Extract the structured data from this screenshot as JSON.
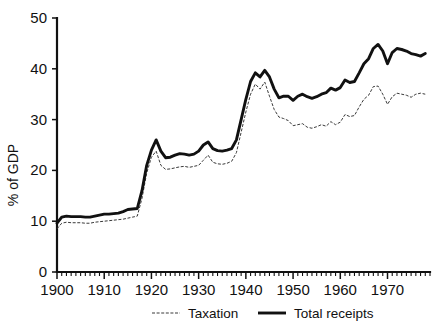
{
  "chart_data": {
    "type": "line",
    "title": "",
    "xlabel": "",
    "ylabel": "% of GDP",
    "xlim": [
      1900,
      1979
    ],
    "ylim": [
      0,
      50
    ],
    "grid": false,
    "legend_position": "bottom",
    "y_ticks": [
      0,
      10,
      20,
      30,
      40,
      50
    ],
    "y_tick_labels": [
      "0",
      "10",
      "20",
      "30",
      "40",
      "50"
    ],
    "x_ticks": [
      1900,
      1910,
      1920,
      1930,
      1940,
      1950,
      1960,
      1970
    ],
    "x_tick_labels": [
      "1900",
      "1910",
      "1920",
      "1930",
      "1940",
      "1950",
      "1960",
      "1970"
    ],
    "x_minor_tick_step": 1,
    "x": [
      1900,
      1901,
      1902,
      1903,
      1904,
      1905,
      1906,
      1907,
      1908,
      1909,
      1910,
      1911,
      1912,
      1913,
      1914,
      1915,
      1916,
      1917,
      1918,
      1919,
      1920,
      1921,
      1922,
      1923,
      1924,
      1925,
      1926,
      1927,
      1928,
      1929,
      1930,
      1931,
      1932,
      1933,
      1934,
      1935,
      1936,
      1937,
      1938,
      1939,
      1940,
      1941,
      1942,
      1943,
      1944,
      1945,
      1946,
      1947,
      1948,
      1949,
      1950,
      1951,
      1952,
      1953,
      1954,
      1955,
      1956,
      1957,
      1958,
      1959,
      1960,
      1961,
      1962,
      1963,
      1964,
      1965,
      1966,
      1967,
      1968,
      1969,
      1970,
      1971,
      1972,
      1973,
      1974,
      1975,
      1976,
      1977,
      1978
    ],
    "series": [
      {
        "name": "Total receipts",
        "style": "solid",
        "color": "#111111",
        "values": [
          9.6,
          10.8,
          11.0,
          10.9,
          10.9,
          10.9,
          10.8,
          10.8,
          11.0,
          11.2,
          11.4,
          11.4,
          11.5,
          11.6,
          11.9,
          12.3,
          12.4,
          12.5,
          16.0,
          21.0,
          24.0,
          26.0,
          23.8,
          22.5,
          22.6,
          23.0,
          23.3,
          23.2,
          23.0,
          23.2,
          23.8,
          25.0,
          25.6,
          24.3,
          23.9,
          23.8,
          24.0,
          24.3,
          26.0,
          30.0,
          34.0,
          37.5,
          39.2,
          38.4,
          39.7,
          38.4,
          36.0,
          34.3,
          34.6,
          34.6,
          33.8,
          34.6,
          35.0,
          34.5,
          34.2,
          34.5,
          35.0,
          35.3,
          36.2,
          35.8,
          36.3,
          37.8,
          37.3,
          37.5,
          39.2,
          41.0,
          42.0,
          44.0,
          44.8,
          43.5,
          41.0,
          43.2,
          44.0,
          43.8,
          43.5,
          43.0,
          42.8,
          42.5,
          43.0
        ]
      },
      {
        "name": "Taxation",
        "style": "dotted",
        "color": "#3a3a3a",
        "values": [
          8.5,
          9.6,
          9.8,
          9.7,
          9.7,
          9.7,
          9.6,
          9.6,
          9.8,
          9.9,
          10.0,
          10.1,
          10.2,
          10.3,
          10.4,
          10.6,
          10.8,
          11.0,
          14.5,
          19.5,
          22.6,
          23.8,
          21.0,
          20.2,
          20.3,
          20.5,
          20.7,
          20.8,
          20.6,
          20.8,
          21.0,
          22.0,
          23.0,
          21.6,
          21.3,
          21.2,
          21.4,
          21.8,
          23.5,
          27.5,
          31.5,
          35.0,
          37.0,
          36.0,
          37.4,
          34.6,
          32.0,
          30.5,
          30.2,
          29.8,
          28.8,
          29.0,
          29.2,
          28.5,
          28.3,
          28.6,
          29.0,
          28.7,
          29.6,
          29.0,
          29.5,
          31.0,
          30.6,
          30.8,
          32.5,
          34.0,
          34.8,
          36.5,
          36.6,
          35.0,
          33.0,
          34.5,
          35.2,
          35.0,
          34.8,
          34.4,
          35.0,
          35.2,
          35.0
        ]
      }
    ],
    "legend": [
      {
        "label": "Taxation",
        "style": "dotted"
      },
      {
        "label": "Total receipts",
        "style": "solid"
      }
    ]
  }
}
